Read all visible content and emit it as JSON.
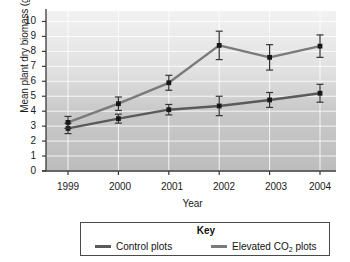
{
  "chart_data": {
    "type": "line",
    "title": "",
    "xlabel": "Year",
    "ylabel": "Mean plant dry biomass (g)",
    "categories": [
      "1999",
      "2000",
      "2001",
      "2002",
      "2003",
      "2004"
    ],
    "x_tick_labels": [
      "1999",
      "2000",
      "2001",
      "2002",
      "2003",
      "2004"
    ],
    "y_tick_labels": [
      "10",
      "9",
      "8",
      "7",
      "6",
      "5",
      "4",
      "3",
      "2",
      "1",
      "0"
    ],
    "ylim": [
      0,
      10.7
    ],
    "y_major_step": 1,
    "grid": true,
    "legend_position": "bottom",
    "legend_title": "Key",
    "series": [
      {
        "name": "Control plots",
        "color": "#5a5a5a",
        "values": [
          2.85,
          3.5,
          4.1,
          4.35,
          4.75,
          5.2
        ],
        "error": [
          0.35,
          0.3,
          0.35,
          0.65,
          0.5,
          0.6
        ]
      },
      {
        "name": "Elevated CO2 plots",
        "label_prefix": "Elevated CO",
        "label_subscript": "2",
        "label_suffix": " plots",
        "color": "#7a7a7a",
        "values": [
          3.25,
          4.5,
          5.9,
          8.4,
          7.6,
          8.35
        ],
        "error": [
          0.4,
          0.45,
          0.5,
          0.95,
          0.85,
          0.75
        ]
      }
    ]
  },
  "key": {
    "title": "Key",
    "entries": [
      {
        "label": "Control plots"
      },
      {
        "label_prefix": "Elevated CO",
        "label_sub": "2",
        "label_suffix": " plots"
      }
    ]
  }
}
